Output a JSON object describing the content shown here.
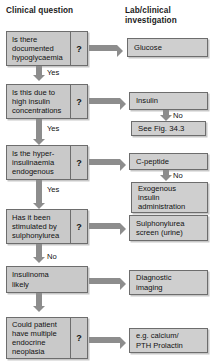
{
  "headers": {
    "left": "Clinical question",
    "right": "Lab/clinical\ninvestigation"
  },
  "questions": [
    {
      "id": "q1",
      "text": "Is there\ndocumented\nhypoglycaemia",
      "marker": "?"
    },
    {
      "id": "q2",
      "text": "Is this due to\nhigh insulin\nconcentrations",
      "marker": "?"
    },
    {
      "id": "q3",
      "text": "Is the hyper-\ninsulinaemia\nendogenous",
      "marker": "?"
    },
    {
      "id": "q4",
      "text": "Has it been\nstimulated by\nsulphonylurea",
      "marker": "?"
    },
    {
      "id": "q5",
      "text": "Insulinoma\nlikely",
      "marker": ""
    },
    {
      "id": "q6",
      "text": "Could patient\nhave multiple\nendocrine\nneoplasia",
      "marker": "?"
    }
  ],
  "investigations": [
    {
      "id": "i1",
      "text": "Glucose"
    },
    {
      "id": "i2",
      "text": "Insulin"
    },
    {
      "id": "i3",
      "text": "See Fig. 34.3"
    },
    {
      "id": "i4",
      "text": "C-peptide"
    },
    {
      "id": "i5",
      "text": "Exogenous\ninsulin\nadministration"
    },
    {
      "id": "i6",
      "text": "Sulphonylurea\nscreen (urine)"
    },
    {
      "id": "i7",
      "text": "Diagnostic\nimaging"
    },
    {
      "id": "i8",
      "text": "e.g. calcium/\nPTH Prolactin"
    }
  ],
  "branch_labels": {
    "yes1": "Yes",
    "yes2": "Yes",
    "yes3": "Yes",
    "no_main": "No",
    "no_insulin": "No",
    "no_cpeptide": "No"
  },
  "colors": {
    "box_fill": "#c9c9c9",
    "lab_fill": "#cfcfcf",
    "box_border": "#6d6d6d",
    "arrow": "#8d8d8d",
    "text": "#111111",
    "background": "#ffffff"
  }
}
